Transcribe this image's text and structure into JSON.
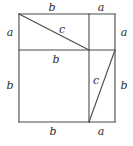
{
  "figure": {
    "type": "geometric-diagram",
    "canvas": {
      "width": 133,
      "height": 146
    },
    "style": {
      "background": "#ffffff",
      "stroke": "#4a4a4a",
      "stroke_width": 1.1,
      "label_color": "#2b2b2b",
      "label_font_size": 11
    },
    "square": {
      "name": "outer-square",
      "left": 19,
      "top": 14,
      "right": 115,
      "bottom": 122,
      "side_composition": "a + b"
    },
    "segments": [
      {
        "name": "outer-top-edge",
        "x1": 19,
        "y1": 14,
        "x2": 115,
        "y2": 14,
        "kind": "edge"
      },
      {
        "name": "outer-right-edge",
        "x1": 115,
        "y1": 14,
        "x2": 115,
        "y2": 122,
        "kind": "edge"
      },
      {
        "name": "outer-bottom-edge",
        "x1": 115,
        "y1": 122,
        "x2": 19,
        "y2": 122,
        "kind": "edge"
      },
      {
        "name": "outer-left-edge",
        "x1": 19,
        "y1": 122,
        "x2": 19,
        "y2": 14,
        "kind": "edge"
      },
      {
        "name": "inner-horizontal-line",
        "x1": 19,
        "y1": 50,
        "x2": 115,
        "y2": 50,
        "kind": "divider"
      },
      {
        "name": "inner-vertical-line",
        "x1": 89,
        "y1": 14,
        "x2": 89,
        "y2": 122,
        "kind": "divider"
      },
      {
        "name": "hypotenuse-upper",
        "x1": 19,
        "y1": 14,
        "x2": 89,
        "y2": 50,
        "kind": "hypotenuse"
      },
      {
        "name": "hypotenuse-lower",
        "x1": 89,
        "y1": 122,
        "x2": 115,
        "y2": 50,
        "kind": "hypotenuse"
      }
    ],
    "labels": [
      {
        "name": "label-top-b",
        "text": "b",
        "x": 52,
        "y": 7
      },
      {
        "name": "label-top-a",
        "text": "a",
        "x": 101,
        "y": 7
      },
      {
        "name": "label-left-a",
        "text": "a",
        "x": 10,
        "y": 32
      },
      {
        "name": "label-left-b",
        "text": "b",
        "x": 10,
        "y": 85
      },
      {
        "name": "label-right-a",
        "text": "a",
        "x": 124,
        "y": 32
      },
      {
        "name": "label-right-b",
        "text": "b",
        "x": 124,
        "y": 85
      },
      {
        "name": "label-bottom-b",
        "text": "b",
        "x": 53,
        "y": 131
      },
      {
        "name": "label-bottom-a",
        "text": "a",
        "x": 101,
        "y": 131
      },
      {
        "name": "label-hypotenuse-upper",
        "text": "c",
        "x": 62,
        "y": 29
      },
      {
        "name": "label-inner-b",
        "text": "b",
        "x": 56,
        "y": 59
      },
      {
        "name": "label-hypotenuse-lower",
        "text": "c",
        "x": 96,
        "y": 80
      }
    ]
  }
}
